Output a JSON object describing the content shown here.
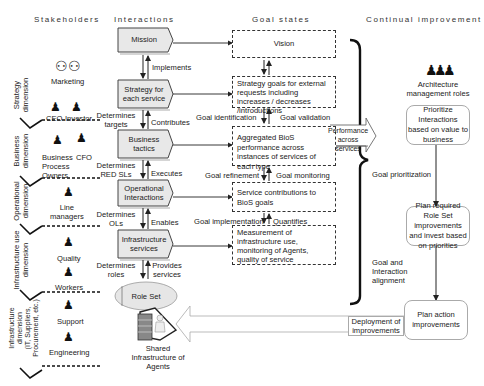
{
  "headers": {
    "stakeholders": "Stakeholders",
    "interactions": "Interactions",
    "goal_states": "Goal states",
    "continual_improvement": "Continual improvement"
  },
  "stakeholders": {
    "marketing": "Marketing",
    "ceo": "CEO",
    "investor": "Investor",
    "business_process_owners": "Business\nProcess\nOwners",
    "cfo": "CFO",
    "line_managers": "Line\nmanagers",
    "quality": "Quality",
    "workers": "Workers",
    "support": "Support",
    "engineering": "Engineering"
  },
  "dimensions": [
    {
      "label": "Strategy\ndimension"
    },
    {
      "label": "Business\ndimension"
    },
    {
      "label": "Operational\ndimension"
    },
    {
      "label": "Infrastructure use\ndimension"
    },
    {
      "label": "Infrastructure\ndimension\n(IT, Suppliers,\nProcurement, etc.)"
    }
  ],
  "interactions": [
    {
      "label": "Mission"
    },
    {
      "label": "Strategy for each service"
    },
    {
      "label": "Business tactics"
    },
    {
      "label": "Operational Interactions"
    },
    {
      "label": "Infrastructure services"
    }
  ],
  "relations": {
    "implements": "Implements",
    "determines_targets": "Determines targets",
    "contributes": "Contributes",
    "determines_red_sls": "Determines RED SLs",
    "executes": "Executes",
    "determines_ols": "Determines OLs",
    "enables": "Enables",
    "determines_roles": "Determines roles",
    "provides_services": "Provides services"
  },
  "role_set": {
    "label": "Role Set",
    "shared_label": "Shared Infrastructure of Agents",
    "agent_letter": "A"
  },
  "goal_states": [
    {
      "label": "Vision"
    },
    {
      "label": "Strategy goals for external requests including increases / decreases /introductions"
    },
    {
      "label": "Aggregated BioS performance across instances of services of each type"
    },
    {
      "label": "Service contributions to BioS goals"
    },
    {
      "label": "Measurement of infrastructure use, monitoring of Agents, quality of service"
    }
  ],
  "goal_relations": {
    "goal_identification": "Goal identification",
    "goal_validation": "Goal validation",
    "goal_refinement": "Goal refinement",
    "goal_monitoring": "Goal monitoring",
    "goal_implementation": "Goal implementation",
    "quantifies": "Quantifies"
  },
  "improvement": {
    "architecture_roles": "Architecture management roles",
    "performance_arrow": "Performance across services",
    "step1": "Prioritize Interactions based on value to business",
    "goal_prioritization": "Goal prioritization",
    "step2": "Plan required Role Set improvements and invest based on priorities",
    "goal_alignment": "Goal and Interaction alignment",
    "step3": "Plan action improvements",
    "deployment_arrow": "Deployment of improvements"
  }
}
